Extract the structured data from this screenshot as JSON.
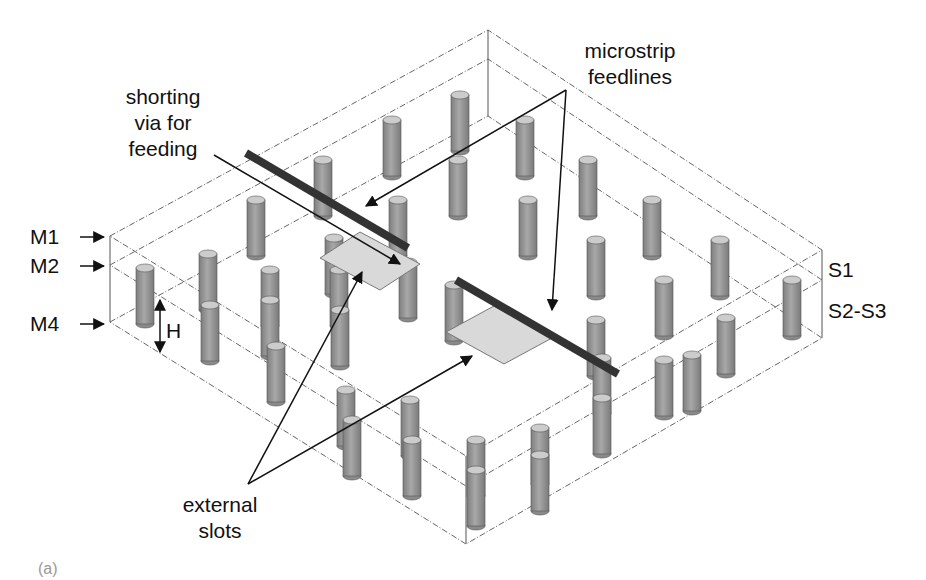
{
  "figure": {
    "panel_label": "(a)",
    "colors": {
      "outline": "#555555",
      "via_body": "#9a9a9a",
      "via_top": "#c8c8c8",
      "feedline": "#3a3a3a",
      "slot": "#d8d8d8",
      "text": "#111111"
    }
  },
  "annotations": {
    "shorting_via": "shorting\nvia for\nfeeding",
    "microstrip": "microstrip\nfeedlines",
    "external_slots": "external\nslots",
    "height": "H"
  },
  "layers": {
    "metal": [
      "M1",
      "M2",
      "M4"
    ],
    "substrate": [
      "S1",
      "S2-S3"
    ]
  }
}
